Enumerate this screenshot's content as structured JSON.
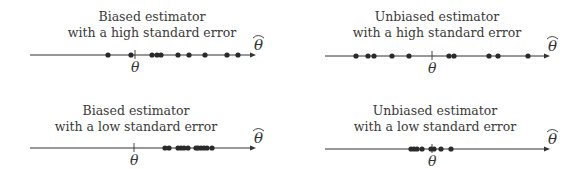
{
  "panels": [
    {
      "id": "biased-high",
      "title_line1": "Biased estimator",
      "title_line2": "with a high standard error",
      "axis": {
        "x1": 30,
        "x2": 256,
        "y": 55
      },
      "true_value_x": 135,
      "dots": [
        108,
        131,
        152,
        157,
        161,
        178,
        189,
        205,
        227,
        238
      ],
      "title_center": 152,
      "title_top": 9
    },
    {
      "id": "unbiased-high",
      "title_line1": "Unbiased estimator",
      "title_line2": "with a high standard error",
      "axis": {
        "x1": 325,
        "x2": 550,
        "y": 56
      },
      "true_value_x": 432,
      "dots": [
        356,
        368,
        374,
        392,
        409,
        449,
        454,
        489,
        498,
        528
      ],
      "title_center": 437,
      "title_top": 9
    },
    {
      "id": "biased-low",
      "title_line1": "Biased estimator",
      "title_line2": "with a low standard error",
      "axis": {
        "x1": 30,
        "x2": 256,
        "y": 148
      },
      "true_value_x": 134,
      "dots": [
        165,
        169,
        178,
        181,
        184,
        188,
        196,
        198,
        201,
        204,
        207,
        212
      ],
      "title_center": 136,
      "title_top": 103
    },
    {
      "id": "unbiased-low",
      "title_line1": "Unbiased estimator",
      "title_line2": "with a low standard error",
      "axis": {
        "x1": 325,
        "x2": 550,
        "y": 149
      },
      "true_value_x": 432,
      "dots": [
        411,
        414,
        417,
        422,
        431,
        434,
        441,
        451
      ],
      "title_center": 435,
      "title_top": 103
    }
  ],
  "labels": {
    "true_param": "θ",
    "estimator": "θ̂"
  },
  "colors": {
    "ink": "#333333",
    "dot": "#2a2a2a"
  }
}
